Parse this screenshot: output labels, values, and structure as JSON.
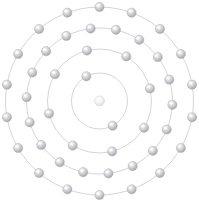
{
  "diagram": {
    "type": "bohr-atom-shell-diagram",
    "canvas": {
      "width": 199,
      "height": 206,
      "background": "#ffffff"
    },
    "center": {
      "x": 99.5,
      "y": 101.0
    },
    "colors": {
      "ring_stroke": "#b9b9bd",
      "electron_light": "#f2f2f4",
      "electron_mid": "#c9c9cd",
      "electron_dark": "#9d9da3",
      "electron_outline": "#a8a8ae",
      "nucleus_light": "#fafafa",
      "nucleus_mid": "#e6e6e8",
      "nucleus_outline": "#d2d2d6",
      "background": "#ffffff"
    },
    "nucleus": {
      "radius": 5.0,
      "label": "nucleus"
    },
    "electron_radius": 4.6,
    "total_electrons": 46,
    "shell_counts": [
      2,
      8,
      18,
      18
    ],
    "shells": [
      {
        "index": 1,
        "name": "K",
        "ring_radius": 28,
        "electron_count": 2,
        "start_angle": 118,
        "electron_angles": [
          118,
          298
        ]
      },
      {
        "index": 2,
        "name": "L",
        "ring_radius": 52,
        "electron_count": 8,
        "start_angle": 104,
        "electron_angles": [
          104,
          149,
          194,
          239,
          284,
          329,
          14,
          59
        ]
      },
      {
        "index": 3,
        "name": "M",
        "ring_radius": 73,
        "electron_count": 18,
        "start_angle": 97,
        "electron_angles": [
          97,
          117,
          137,
          157,
          177,
          197,
          217,
          237,
          257,
          277,
          297,
          317,
          337,
          357,
          17,
          37,
          57,
          77
        ]
      },
      {
        "index": 4,
        "name": "N",
        "ring_radius": 94,
        "electron_count": 18,
        "start_angle": 90,
        "electron_angles": [
          90,
          110,
          130,
          150,
          170,
          190,
          210,
          230,
          250,
          270,
          290,
          310,
          330,
          350,
          10,
          30,
          50,
          70
        ]
      }
    ]
  }
}
